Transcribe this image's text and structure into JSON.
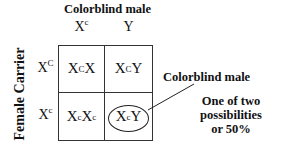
{
  "diagram": {
    "type": "punnett-square",
    "column_title": "Colorblind male",
    "row_title": "Female Carrier",
    "columns": [
      {
        "base": "X",
        "sup": "c"
      },
      {
        "base": "Y",
        "sup": ""
      }
    ],
    "rows": [
      {
        "base": "X",
        "sup": "C"
      },
      {
        "base": "X",
        "sup": "c"
      }
    ],
    "cells": [
      [
        {
          "a": "X",
          "a_sup": "C",
          "b": "X",
          "b_sup": ""
        },
        {
          "a": "X",
          "a_sup": "C",
          "b": "Y",
          "b_sup": ""
        }
      ],
      [
        {
          "a": "X",
          "a_sup": "c",
          "b": "X",
          "b_sup": "c"
        },
        {
          "a": "X",
          "a_sup": "c",
          "b": "Y",
          "b_sup": "",
          "circled": true
        }
      ]
    ],
    "callout_label": "Colorblind male",
    "note_lines": [
      "One of two",
      "possibilities",
      "or 50%"
    ],
    "colors": {
      "line": "#333333",
      "text": "#111111",
      "background": "#ffffff"
    }
  }
}
